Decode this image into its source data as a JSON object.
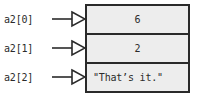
{
  "diagram": {
    "colors": {
      "background": "#ffffff",
      "cell_fill": "#ededed",
      "border": "#2a2a2a",
      "text": "#2b2b2b"
    },
    "rows": [
      {
        "label": "a2[0]",
        "value": "6",
        "arrow": "right-arrowhead"
      },
      {
        "label": "a2[1]",
        "value": "2",
        "arrow": "right-arrowhead"
      },
      {
        "label": "a2[2]",
        "value": "\"That’s it.\"",
        "arrow": "right-arrowhead"
      }
    ]
  }
}
